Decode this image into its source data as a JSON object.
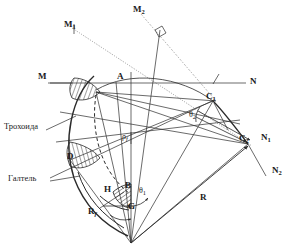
{
  "figure": {
    "type": "engineering-geometry-diagram",
    "language": "ru",
    "background_color": "#ffffff",
    "line_color": "#2b2b2b",
    "hatch_color": "#2b2b2b"
  },
  "annotations": {
    "trochoid_label": "Трохоида",
    "fillet_label": "Галтель"
  },
  "points": {
    "M": "M",
    "M1": "M",
    "M1_sub": "1",
    "M2": "M",
    "M2_sub": "2",
    "N": "N",
    "N1": "N",
    "N1_sub": "1",
    "N2": "N",
    "N2_sub": "2",
    "A": "A",
    "B": "B",
    "D": "D",
    "G": "G",
    "H": "H",
    "C1": "C",
    "C1_sub": "1",
    "C2": "C",
    "C2_sub": "2"
  },
  "quantities": {
    "R": "R",
    "Rf": "R",
    "Rf_sub": "f",
    "rho_f": "ρ",
    "rho_f_sub": "f",
    "theta1": "θ",
    "theta1_sub": "1",
    "theta2": "θ",
    "theta2_sub": "2"
  },
  "label_positions": {
    "Trokhoida": {
      "x": 4,
      "y": 126
    },
    "Galtel": {
      "x": 8,
      "y": 178
    },
    "M": {
      "x": 38,
      "y": 70
    },
    "M1": {
      "x": 64,
      "y": 22
    },
    "M2": {
      "x": 133,
      "y": 7
    },
    "N": {
      "x": 250,
      "y": 79
    },
    "N1": {
      "x": 262,
      "y": 136
    },
    "N2": {
      "x": 273,
      "y": 168
    },
    "A": {
      "x": 117,
      "y": 74
    },
    "B": {
      "x": 125,
      "y": 184
    },
    "D": {
      "x": 67,
      "y": 155
    },
    "G": {
      "x": 128,
      "y": 205
    },
    "H": {
      "x": 104,
      "y": 188
    },
    "C1": {
      "x": 207,
      "y": 95
    },
    "C2": {
      "x": 240,
      "y": 137
    },
    "R": {
      "x": 200,
      "y": 196
    },
    "Rf": {
      "x": 88,
      "y": 211
    },
    "rho_f": {
      "x": 122,
      "y": 136
    },
    "theta1": {
      "x": 139,
      "y": 190
    },
    "theta2": {
      "x": 190,
      "y": 114
    }
  }
}
